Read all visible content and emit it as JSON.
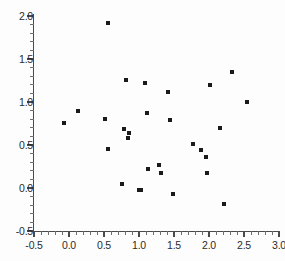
{
  "chart_data": {
    "type": "scatter",
    "title": "",
    "xlabel": "",
    "ylabel": "",
    "xlim": [
      -0.5,
      3.0
    ],
    "ylim": [
      -0.5,
      2.0
    ],
    "grid": false,
    "legend": null,
    "x_ticks": [
      -0.5,
      0.0,
      0.5,
      1.0,
      1.5,
      2.0,
      2.5,
      3.0
    ],
    "x_tick_labels": [
      "-0.5",
      "0.0",
      "0.5",
      "1.0",
      "1.5",
      "2.0",
      "2.5",
      "3.0"
    ],
    "y_ticks": [
      -0.5,
      0.0,
      0.5,
      1.0,
      1.5,
      2.0
    ],
    "y_tick_labels": [
      "-0.5",
      "0.0",
      "0.5",
      "1.0",
      "1.5",
      "2.0"
    ],
    "x_minor_tick_step": 0.1,
    "y_minor_tick_step": 0.1,
    "marker": "filled-square",
    "marker_color": "#1a1a1a",
    "marker_size_px": 4,
    "points": [
      {
        "x": -0.07,
        "y": 0.76
      },
      {
        "x": 0.13,
        "y": 0.9
      },
      {
        "x": 0.51,
        "y": 0.8
      },
      {
        "x": 0.56,
        "y": 1.92
      },
      {
        "x": 0.55,
        "y": 0.45
      },
      {
        "x": 0.75,
        "y": 0.05
      },
      {
        "x": 0.78,
        "y": 0.69
      },
      {
        "x": 0.82,
        "y": 1.26
      },
      {
        "x": 0.85,
        "y": 0.64
      },
      {
        "x": 0.84,
        "y": 0.58
      },
      {
        "x": 1.0,
        "y": -0.02
      },
      {
        "x": 1.03,
        "y": -0.02
      },
      {
        "x": 1.09,
        "y": 1.22
      },
      {
        "x": 1.12,
        "y": 0.87
      },
      {
        "x": 1.13,
        "y": 0.22
      },
      {
        "x": 1.29,
        "y": 0.27
      },
      {
        "x": 1.31,
        "y": 0.17
      },
      {
        "x": 1.42,
        "y": 1.12
      },
      {
        "x": 1.44,
        "y": 0.79
      },
      {
        "x": 1.48,
        "y": -0.07
      },
      {
        "x": 1.77,
        "y": 0.51
      },
      {
        "x": 1.88,
        "y": 0.44
      },
      {
        "x": 1.95,
        "y": 0.36
      },
      {
        "x": 1.97,
        "y": 0.18
      },
      {
        "x": 2.02,
        "y": 1.2
      },
      {
        "x": 2.16,
        "y": 0.7
      },
      {
        "x": 2.21,
        "y": -0.19
      },
      {
        "x": 2.33,
        "y": 1.35
      },
      {
        "x": 2.54,
        "y": 1.0
      }
    ]
  },
  "axes_geometry": {
    "x_origin_px": 34,
    "y_origin_px": 231,
    "px_per_x_unit": 70,
    "px_per_y_unit": 86
  },
  "colors": {
    "background": "#fdfdfd",
    "axis": "#4a4a4a",
    "marker": "#1a1a1a",
    "tick_text": "#2b2b2b"
  }
}
